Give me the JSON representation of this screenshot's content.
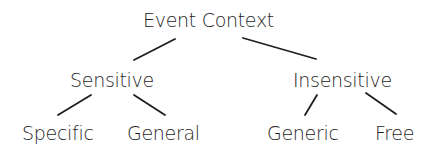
{
  "diagram": {
    "type": "tree",
    "root": {
      "label": "Event Context",
      "children": [
        {
          "label": "Sensitive",
          "children": [
            {
              "label": "Specific"
            },
            {
              "label": "General"
            }
          ]
        },
        {
          "label": "Insensitive",
          "children": [
            {
              "label": "Generic"
            },
            {
              "label": "Free"
            }
          ]
        }
      ]
    },
    "colors": {
      "text": "#1e1e1e",
      "lines": "#1e1e1e",
      "background": "#ffffff"
    }
  }
}
